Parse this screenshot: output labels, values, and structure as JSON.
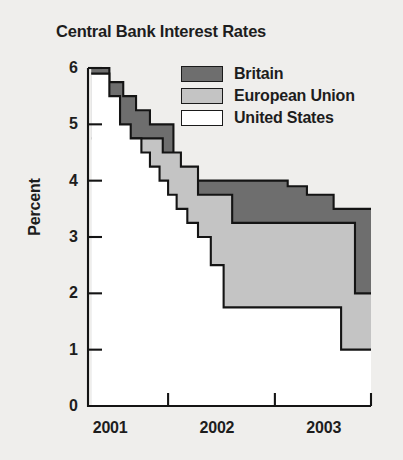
{
  "chart_data": {
    "type": "area",
    "title": "Central Bank Interest Rates",
    "xlabel": "",
    "ylabel": "Percent",
    "ylim": [
      0,
      6
    ],
    "xlim": [
      2000.75,
      2003.4
    ],
    "grid": false,
    "legend_position": "top-right",
    "step_style": "post",
    "y_ticks": [
      "6",
      "5",
      "4",
      "3",
      "2",
      "1",
      "0"
    ],
    "y_tick_values": [
      6,
      5,
      4,
      3,
      2,
      1,
      0
    ],
    "x_ticks": [
      "2001",
      "2002",
      "2003"
    ],
    "x_tick_values": [
      2001,
      2002,
      2003
    ],
    "series": [
      {
        "name": "Britain",
        "color": "#6e6e6e",
        "x": [
          2000.78,
          2000.95,
          2001.08,
          2001.2,
          2001.33,
          2001.55,
          2002.62,
          2002.8,
          2003.05,
          2003.4
        ],
        "values": [
          6.0,
          5.75,
          5.5,
          5.25,
          5.0,
          4.0,
          3.9,
          3.75,
          3.5,
          3.5
        ]
      },
      {
        "name": "European Union",
        "color": "#c4c4c4",
        "x": [
          2000.78,
          2001.33,
          2001.45,
          2001.62,
          2001.78,
          2002.1,
          2002.95,
          2003.25,
          2003.4
        ],
        "values": [
          4.75,
          4.75,
          4.5,
          4.25,
          3.75,
          3.25,
          3.25,
          2.0,
          2.0
        ]
      },
      {
        "name": "United States",
        "color": "#ffffff",
        "x": [
          2000.78,
          2000.95,
          2001.05,
          2001.15,
          2001.25,
          2001.33,
          2001.42,
          2001.5,
          2001.58,
          2001.68,
          2001.78,
          2001.9,
          2002.02,
          2002.85,
          2003.12,
          2003.4
        ],
        "values": [
          5.9,
          5.5,
          5.0,
          4.75,
          4.5,
          4.25,
          4.0,
          3.75,
          3.5,
          3.25,
          3.0,
          2.5,
          1.75,
          1.75,
          1.0,
          1.0
        ]
      }
    ]
  }
}
